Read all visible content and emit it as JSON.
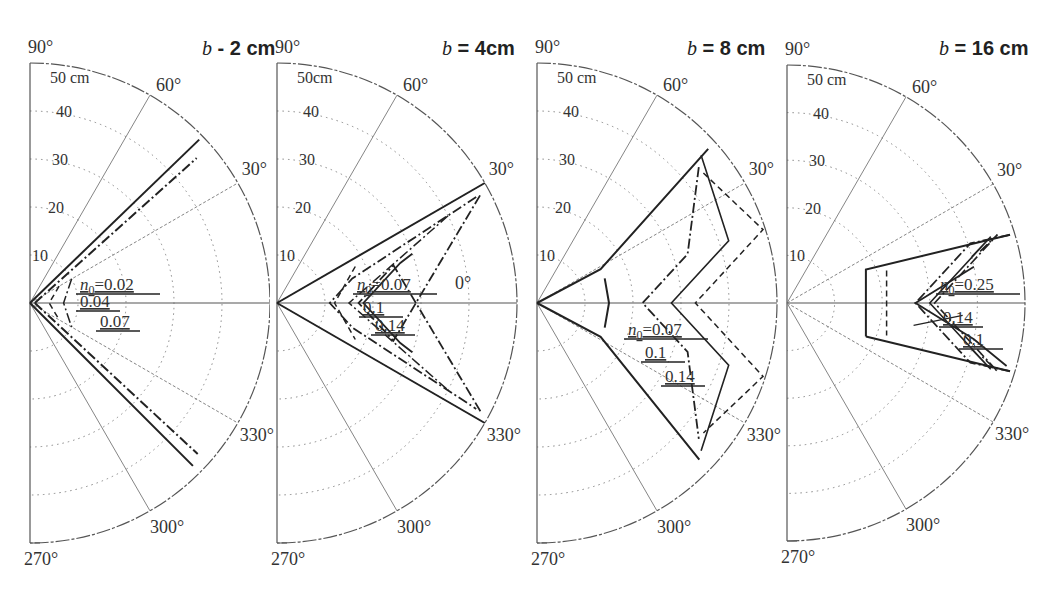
{
  "figure": {
    "width": 1053,
    "height": 602
  },
  "chart_data": [
    {
      "type": "polar",
      "title": "b = 2 cm",
      "title_var": "b",
      "title_value": "2 cm",
      "radial_unit_label": "50 cm",
      "radial_ticks": [
        10,
        20,
        30,
        40,
        50
      ],
      "angle_labels": [
        "90°",
        "60°",
        "30°",
        "0°",
        "330°",
        "300°",
        "270°"
      ],
      "angle_range": [
        270,
        90
      ],
      "center": [
        30,
        303
      ],
      "radius_px": 240,
      "clip_x": 270,
      "series": [
        {
          "name": "n0 = 0.02",
          "style": "solid",
          "points": [
            [
              0,
              0
            ],
            [
              3,
              20
            ],
            [
              48,
              44
            ],
            [
              3,
              -20
            ],
            [
              0,
              0
            ]
          ]
        },
        {
          "name": "n0 = 0.04",
          "style": "dashdot",
          "points": [
            [
              0,
              0
            ],
            [
              6,
              30
            ],
            [
              45,
              41
            ],
            [
              6,
              -30
            ],
            [
              0,
              0
            ]
          ]
        },
        {
          "name": "n0 = 0.07",
          "style": "dashed",
          "points": [
            [
              0,
              0
            ],
            [
              8,
              40
            ],
            [
              46,
              -44
            ],
            [
              8,
              -40
            ]
          ]
        }
      ],
      "annotations": [
        "n0 = 0.02",
        "0.04",
        "0.07"
      ],
      "labels_pos": [
        [
          80,
          290
        ],
        [
          80,
          307
        ],
        [
          100,
          327
        ]
      ]
    },
    {
      "type": "polar",
      "title": "b = 4cm",
      "title_var": "b",
      "title_value": "4cm",
      "radial_unit_label": "50cm",
      "radial_ticks": [
        10,
        20,
        30,
        40,
        50
      ],
      "angle_labels": [
        "90°",
        "60°",
        "30°",
        "0°",
        "330°",
        "300°",
        "270°"
      ],
      "center": [
        277,
        303
      ],
      "radius_px": 240,
      "clip_x": 530,
      "series": [
        {
          "name": "n0 = 0.07",
          "style": "solid",
          "points": [
            [
              0,
              0
            ],
            [
              50,
              30
            ],
            [
              50,
              -30
            ]
          ]
        },
        {
          "name": "n0 = 0.1",
          "style": "dashed",
          "points": [
            [
              9,
              20
            ],
            [
              9,
              0
            ],
            [
              9,
              -20
            ]
          ]
        },
        {
          "name": "n0 = 0.14",
          "style": "dashdot",
          "points": [
            [
              14,
              25
            ],
            [
              14,
              0
            ],
            [
              14,
              -25
            ]
          ]
        }
      ],
      "annotations": [
        "n0 = 0.07",
        "0.1",
        "0.14"
      ],
      "labels_pos": [
        [
          357,
          290
        ],
        [
          363,
          313
        ],
        [
          375,
          331
        ]
      ]
    },
    {
      "type": "polar",
      "title": "b = 8 cm",
      "title_var": "b",
      "title_value": "8 cm",
      "radial_unit_label": "50 cm",
      "radial_ticks": [
        10,
        20,
        30,
        40,
        50
      ],
      "angle_labels": [
        "90°",
        "60°",
        "30°",
        "0°",
        "330°",
        "300°",
        "270°"
      ],
      "center": [
        537,
        303
      ],
      "radius_px": 240,
      "clip_x": 783,
      "series": [
        {
          "name": "n0 = 0.07",
          "style": "solid",
          "points": [
            [
              0,
              0
            ],
            [
              6,
              0
            ],
            [
              47,
              45
            ],
            [
              47,
              -45
            ]
          ]
        },
        {
          "name": "n0 = 0.1",
          "style": "dashed",
          "points": [
            [
              10,
              0
            ]
          ]
        },
        {
          "name": "n0 = 0.14",
          "style": "dashdot",
          "points": [
            [
              13,
              0
            ]
          ]
        }
      ],
      "annotations": [
        "n0 = 0.07",
        "0.1",
        "0.14"
      ],
      "labels_pos": [
        [
          628,
          335
        ],
        [
          645,
          358
        ],
        [
          665,
          382
        ]
      ]
    },
    {
      "type": "polar",
      "title": "b = 16 cm",
      "title_var": "b",
      "title_value": "16 cm",
      "radial_unit_label": "50 cm",
      "radial_ticks": [
        10,
        20,
        30,
        40,
        50
      ],
      "angle_labels": [
        "90°",
        "60°",
        "30°",
        "0°",
        "330°",
        "300°",
        "270°"
      ],
      "center": [
        787,
        303
      ],
      "radius_px": 238,
      "clip_x": 1053,
      "series": [
        {
          "name": "n0 = 0.1",
          "style": "solid",
          "points": [
            [
              13,
              0
            ]
          ]
        },
        {
          "name": "n0 = 0.14",
          "style": "dashdot",
          "points": [
            [
              20,
              0
            ]
          ]
        },
        {
          "name": "n0 = 0.25",
          "style": "solid",
          "points": [
            [
              27,
              0
            ]
          ]
        }
      ],
      "annotations": [
        "n0 = 0.25",
        "0.14",
        "0.1"
      ],
      "labels_pos": [
        [
          940,
          290
        ],
        [
          943,
          323
        ],
        [
          963,
          345
        ]
      ]
    }
  ]
}
